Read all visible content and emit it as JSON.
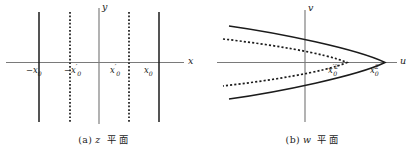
{
  "figure": {
    "background_color": "#ffffff",
    "axis_color": "#7a7a7a",
    "curve_color": "#1b1b1b"
  },
  "panel_z": {
    "caption": {
      "tag": "(a)",
      "variable": "z",
      "plane_word": "平面"
    },
    "axes": {
      "horizontal_label": "x",
      "vertical_label": "y"
    },
    "tick_labels": [
      {
        "id": "neg-x0",
        "text": "−x₀",
        "minus": "−",
        "base": "x",
        "sub": "0",
        "prime": "",
        "x_px": 28,
        "y_px": 66
      },
      {
        "id": "neg-x0-prime",
        "text": "−x′0",
        "minus": "−",
        "base": "x",
        "sub": "0",
        "prime": "′",
        "x_px": 68,
        "y_px": 66
      },
      {
        "id": "pos-x0-prime",
        "text": "x′0",
        "minus": "",
        "base": "x",
        "sub": "0",
        "prime": "′",
        "x_px": 111,
        "y_px": 66
      },
      {
        "id": "pos-x0",
        "text": "x₀",
        "minus": "",
        "base": "x",
        "sub": "0",
        "prime": "",
        "x_px": 145,
        "y_px": 66
      }
    ],
    "vertical_lines": [
      {
        "id": "line-neg-x0",
        "style": "solid",
        "x_px": 39
      },
      {
        "id": "line-neg-x0-prime",
        "style": "dotted",
        "x_px": 70
      },
      {
        "id": "line-y-axis",
        "style": "axis",
        "x_px": 99
      },
      {
        "id": "line-pos-x0-prime",
        "style": "dotted",
        "x_px": 129
      },
      {
        "id": "line-pos-x0",
        "style": "solid",
        "x_px": 159
      }
    ]
  },
  "panel_w": {
    "caption": {
      "tag": "(b)",
      "variable": "w",
      "plane_word": "平面"
    },
    "axes": {
      "horizontal_label": "u",
      "vertical_label": "v"
    },
    "tick_labels": [
      {
        "id": "x0-prime-squared",
        "text": "x′0²",
        "base": "x",
        "sub": "0",
        "prime": "′",
        "sup": "2",
        "x_px": 120,
        "y_px": 66
      },
      {
        "id": "x0-squared",
        "text": "x₀²",
        "base": "x",
        "sub": "0",
        "prime": "",
        "sup": "2",
        "x_px": 162,
        "y_px": 66
      }
    ],
    "curves": [
      {
        "id": "parabola-outer",
        "style": "solid",
        "vertex_u_px": 176,
        "label_ref": "x0-squared"
      },
      {
        "id": "parabola-inner",
        "style": "dotted",
        "vertex_u_px": 138,
        "label_ref": "x0-prime-squared"
      }
    ]
  }
}
